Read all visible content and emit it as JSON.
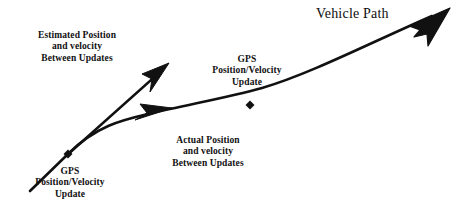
{
  "figure": {
    "title": "Vehicle Path",
    "background_color": "#ffffff",
    "ink_color": "#111111"
  },
  "labels": {
    "estimated": {
      "line1": "Estimated Position",
      "line2": "and velocity",
      "line3": "Between Updates"
    },
    "gps_start": {
      "line1": "GPS",
      "line2": "Position/Velocity",
      "line3": "Update"
    },
    "actual": {
      "line1": "Actual Position",
      "line2": "and velocity",
      "line3": "Between Updates"
    },
    "gps_mid": {
      "line1": "GPS",
      "line2": "Position/Velocity",
      "line3": "Update"
    }
  },
  "markers": {
    "gps_start_point": "gps-update-marker",
    "gps_mid_point": "gps-update-marker"
  },
  "arrows": {
    "estimated_arrow": "estimated-trajectory-arrow",
    "actual_arrow": "actual-trajectory-arrow",
    "vehicle_path_arrow": "vehicle-path-arrow"
  }
}
